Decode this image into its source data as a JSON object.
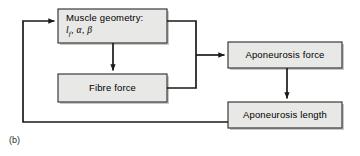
{
  "figure": {
    "caption": "(b)",
    "box_fill": "#e8e8e6",
    "box_border": "#3a3a3a",
    "line_color": "#1a1a1a",
    "text_color": "#000000"
  },
  "nodes": {
    "muscle_geometry": {
      "line1": "Muscle geometry:",
      "symbol_l": "l",
      "symbol_l_sub": "f",
      "symbol_sep1": ", ",
      "symbol_alpha": "α",
      "symbol_sep2": ", ",
      "symbol_beta": "β"
    },
    "fibre_force": {
      "label": "Fibre force"
    },
    "aponeurosis_force": {
      "label": "Aponeurosis force"
    },
    "aponeurosis_length": {
      "label": "Aponeurosis length"
    }
  },
  "edges": [
    {
      "name": "muscle-geometry-to-fibre-force",
      "from": "muscle_geometry",
      "to": "fibre_force",
      "arrow": true
    },
    {
      "name": "muscle-geometry-to-aponeurosis-force",
      "from": "muscle_geometry",
      "to": "aponeurosis_force",
      "arrow": true
    },
    {
      "name": "fibre-force-to-aponeurosis-force",
      "from": "fibre_force",
      "to": "aponeurosis_force",
      "arrow": true
    },
    {
      "name": "aponeurosis-force-to-aponeurosis-length",
      "from": "aponeurosis_force",
      "to": "aponeurosis_length",
      "arrow": true
    },
    {
      "name": "aponeurosis-length-feedback-to-muscle-geometry",
      "from": "aponeurosis_length",
      "to": "muscle_geometry",
      "arrow": true
    }
  ]
}
